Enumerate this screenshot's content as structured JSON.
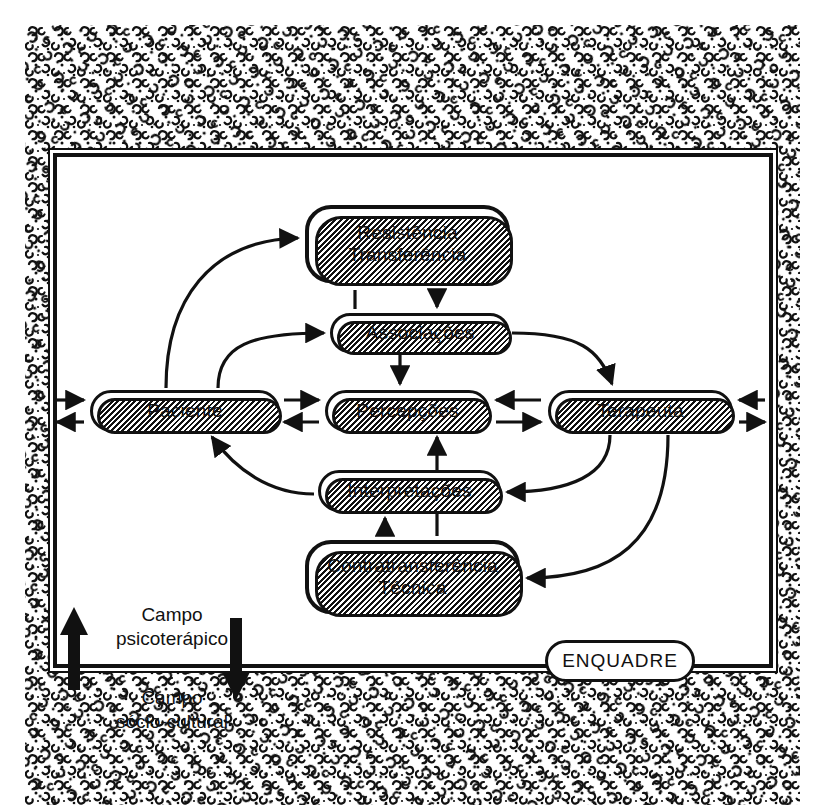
{
  "diagram": {
    "title_region": "Campo psicoterapico diagram",
    "frame_label": "ENQUADRE",
    "nodes": [
      {
        "id": "resistencia",
        "label": "Resistência\nTransferência",
        "line1": "Resistência",
        "line2": "Transferência"
      },
      {
        "id": "associacoes",
        "label": "Associações",
        "line1": "Associações",
        "line2": ""
      },
      {
        "id": "paciente",
        "label": "Paciente",
        "line1": "Paciente",
        "line2": ""
      },
      {
        "id": "percepcoes",
        "label": "Percepções",
        "line1": "Percepções",
        "line2": ""
      },
      {
        "id": "terapeuta",
        "label": "Terapeuta",
        "line1": "Terapeuta",
        "line2": ""
      },
      {
        "id": "interpretacoes",
        "label": "Interpretações",
        "line1": "Interpretações",
        "line2": ""
      },
      {
        "id": "contratransferencia",
        "label": "Contratransferência\nTécnica",
        "line1": "Contratransferência",
        "line2": "Técnica"
      },
      {
        "id": "enquadre",
        "label": "ENQUADRE",
        "line1": "ENQUADRE",
        "line2": ""
      }
    ],
    "captions": {
      "campo_psicoterapico_line1": "Campo",
      "campo_psicoterapico_line2": "psicoterápico",
      "campo_sociocultural_line1": "Campo",
      "campo_sociocultural_line2": "sócio-cultural"
    },
    "colors": {
      "ink": "#111111",
      "paper": "#ffffff"
    }
  }
}
